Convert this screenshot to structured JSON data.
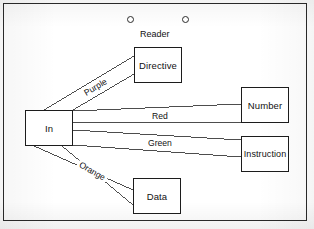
{
  "figure": {
    "title_label": "Reader",
    "border_color": "#1c1c1c",
    "line_color": "#3a3a3a",
    "background": "#ffffff"
  },
  "ports": [
    {
      "name": "reader-port-left",
      "shape": "circle",
      "cx": 131,
      "cy": 20,
      "r": 3.5
    },
    {
      "name": "reader-port-right",
      "shape": "circle",
      "cx": 186,
      "cy": 20,
      "r": 3.5
    }
  ],
  "nodes": [
    {
      "id": "in",
      "label": "In",
      "x": 25,
      "y": 110,
      "w": 48,
      "h": 36
    },
    {
      "id": "directive",
      "label": "Directive",
      "x": 134,
      "y": 47,
      "w": 48,
      "h": 36
    },
    {
      "id": "number",
      "label": "Number",
      "x": 241,
      "y": 87,
      "w": 48,
      "h": 36
    },
    {
      "id": "instruction",
      "label": "Instruction",
      "x": 241,
      "y": 136,
      "w": 48,
      "h": 36
    },
    {
      "id": "data",
      "label": "Data",
      "x": 133,
      "y": 178,
      "w": 48,
      "h": 36
    }
  ],
  "connections": [
    {
      "id": "purple",
      "label": "Purple",
      "from": "in",
      "to": "directive",
      "orientation": "diagonal-up",
      "label_x": 98,
      "label_y": 88
    },
    {
      "id": "red",
      "label": "Red",
      "from": "in",
      "to": "number",
      "orientation": "horizontal",
      "label_x": 160,
      "label_y": 117
    },
    {
      "id": "green",
      "label": "Green",
      "from": "in",
      "to": "instruction",
      "orientation": "horizontal",
      "label_x": 160,
      "label_y": 144
    },
    {
      "id": "orange",
      "label": "Orange",
      "from": "in",
      "to": "data",
      "orientation": "diagonal-down",
      "label_x": 96,
      "label_y": 173
    }
  ]
}
